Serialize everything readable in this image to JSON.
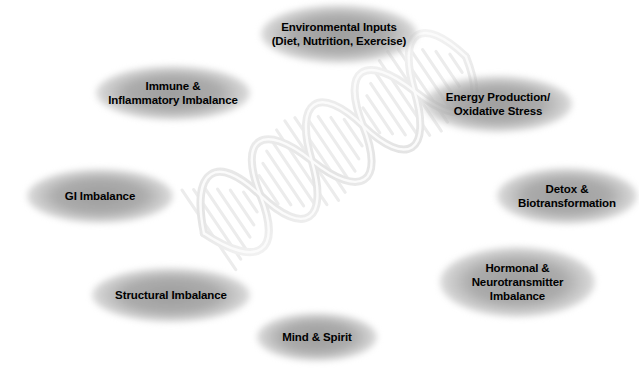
{
  "diagram": {
    "background_color": "#ffffff",
    "node_fill_color": "#a0a0a0",
    "node_text_color": "#000000",
    "helix_color": "#ededed",
    "center_graphic": "dna-double-helix",
    "nodes": [
      {
        "id": "environmental-inputs",
        "label": "Environmental Inputs\n(Diet, Nutrition, Exercise)",
        "x": 261,
        "y": 5,
        "w": 156,
        "h": 58,
        "font_size": 11.5
      },
      {
        "id": "immune-inflammatory-imbalance",
        "label": "Immune &\nInflammatory Imbalance",
        "x": 96,
        "y": 66,
        "w": 154,
        "h": 54,
        "font_size": 11.5
      },
      {
        "id": "energy-production-oxidative-stress",
        "label": "Energy Production/\nOxidative Stress",
        "x": 424,
        "y": 76,
        "w": 148,
        "h": 56,
        "font_size": 11.5
      },
      {
        "id": "gi-imbalance",
        "label": "GI Imbalance",
        "x": 27,
        "y": 169,
        "w": 146,
        "h": 54,
        "font_size": 11.5
      },
      {
        "id": "detox-biotransformation",
        "label": "Detox &\nBiotransformation",
        "x": 497,
        "y": 168,
        "w": 140,
        "h": 56,
        "font_size": 11.5
      },
      {
        "id": "structural-imbalance",
        "label": "Structural Imbalance",
        "x": 92,
        "y": 268,
        "w": 158,
        "h": 54,
        "font_size": 11.5
      },
      {
        "id": "hormonal-neurotransmitter-imbalance",
        "label": "Hormonal &\nNeurotransmitter\nImbalance",
        "x": 440,
        "y": 247,
        "w": 155,
        "h": 70,
        "font_size": 11.5
      },
      {
        "id": "mind-spirit",
        "label": "Mind & Spirit",
        "x": 257,
        "y": 313,
        "w": 120,
        "h": 48,
        "font_size": 11.5
      }
    ]
  }
}
